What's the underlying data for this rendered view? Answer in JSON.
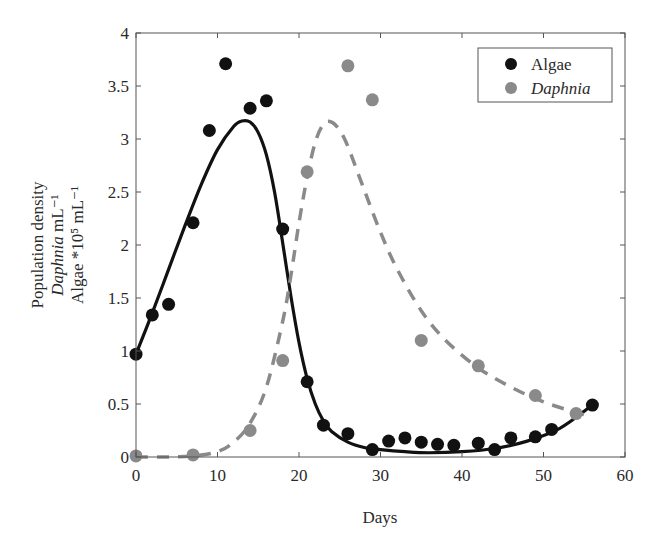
{
  "chart_data": {
    "type": "scatter",
    "title": "",
    "xlabel": "Days",
    "ylabel_lines": [
      "Population density",
      "Daphnia mL⁻¹",
      "Algae *10⁵ mL⁻¹"
    ],
    "xlim": [
      0,
      60
    ],
    "ylim": [
      0,
      4
    ],
    "x_ticks": [
      0,
      10,
      20,
      30,
      40,
      50,
      60
    ],
    "y_ticks": [
      0,
      0.5,
      1,
      1.5,
      2,
      2.5,
      3,
      3.5,
      4
    ],
    "y_tick_labels": [
      "0",
      "0.5",
      "1",
      "1.5",
      "2",
      "2.5",
      "3",
      "3.5",
      "4"
    ],
    "grid": false,
    "legend_position": "upper right",
    "series": [
      {
        "name": "Algae",
        "marker": "circle",
        "color": "#111111",
        "x": [
          0,
          2,
          4,
          7,
          9,
          11,
          14,
          16,
          18,
          21,
          23,
          26,
          29,
          31,
          33,
          35,
          37,
          39,
          42,
          44,
          46,
          49,
          51,
          56
        ],
        "y": [
          0.97,
          1.34,
          1.44,
          2.21,
          3.08,
          3.71,
          3.29,
          3.36,
          2.15,
          0.71,
          0.3,
          0.22,
          0.07,
          0.15,
          0.18,
          0.14,
          0.12,
          0.11,
          0.13,
          0.07,
          0.18,
          0.19,
          0.26,
          0.49
        ]
      },
      {
        "name": "Daphnia",
        "marker": "circle",
        "color": "#8a8a8a",
        "x": [
          0,
          7,
          14,
          18,
          21,
          26,
          29,
          35,
          42,
          49,
          54
        ],
        "y": [
          0.01,
          0.02,
          0.25,
          0.91,
          2.69,
          3.69,
          3.37,
          1.1,
          0.86,
          0.58,
          0.41
        ]
      }
    ],
    "fitted_curves": [
      {
        "name": "Algae model",
        "style": "solid",
        "color": "#111111",
        "x": [
          0,
          2,
          4,
          6,
          8,
          10,
          12,
          13,
          14,
          15,
          16,
          17,
          18,
          19,
          20,
          21,
          22,
          23,
          24,
          26,
          28,
          30,
          33,
          36,
          40,
          44,
          48,
          52,
          56
        ],
        "y": [
          0.97,
          1.36,
          1.77,
          2.18,
          2.57,
          2.9,
          3.12,
          3.17,
          3.16,
          3.06,
          2.85,
          2.5,
          2.02,
          1.52,
          1.08,
          0.74,
          0.5,
          0.34,
          0.24,
          0.14,
          0.09,
          0.07,
          0.05,
          0.04,
          0.05,
          0.08,
          0.15,
          0.27,
          0.49
        ]
      },
      {
        "name": "Daphnia model",
        "style": "dashed",
        "color": "#8a8a8a",
        "x": [
          0,
          4,
          7,
          10,
          12,
          14,
          16,
          18,
          19,
          20,
          21,
          22,
          23,
          24,
          25,
          26,
          28,
          30,
          32,
          35,
          38,
          42,
          46,
          50,
          54,
          56
        ],
        "y": [
          0.0,
          0.0,
          0.01,
          0.05,
          0.14,
          0.32,
          0.66,
          1.28,
          1.71,
          2.21,
          2.64,
          2.97,
          3.14,
          3.16,
          3.08,
          2.93,
          2.52,
          2.12,
          1.78,
          1.38,
          1.1,
          0.84,
          0.66,
          0.52,
          0.42,
          0.38
        ]
      }
    ]
  },
  "legend": {
    "items": [
      {
        "label": "Algae",
        "color": "#111111",
        "italic": false
      },
      {
        "label": "Daphnia",
        "color": "#8a8a8a",
        "italic": true
      }
    ]
  },
  "axes": {
    "xlabel": "Days"
  }
}
